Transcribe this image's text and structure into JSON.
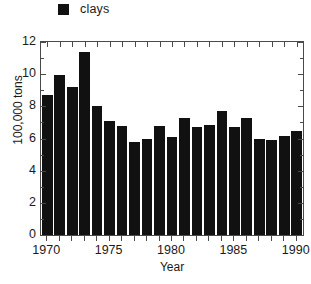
{
  "legend": {
    "entries": [
      {
        "label": "clays",
        "color": "#111111",
        "marker": "square"
      }
    ],
    "position": "top-left"
  },
  "axis_titles": {
    "x": "Year",
    "y": "100,000 tons"
  },
  "chart_data": {
    "type": "bar",
    "title": "",
    "subtitle": "",
    "xlabel": "Year",
    "ylabel": "100,000 tons",
    "xlim": [
      1969.5,
      1990.5
    ],
    "ylim": [
      0,
      12
    ],
    "grid": false,
    "legend_position": "top-left",
    "bar_color": "#111111",
    "categories": [
      "1970",
      "1971",
      "1972",
      "1973",
      "1974",
      "1975",
      "1976",
      "1977",
      "1978",
      "1979",
      "1980",
      "1981",
      "1982",
      "1983",
      "1984",
      "1985",
      "1986",
      "1987",
      "1988",
      "1989",
      "1990"
    ],
    "series": [
      {
        "name": "clays",
        "values": [
          8.7,
          9.95,
          9.2,
          11.4,
          8.05,
          7.1,
          6.8,
          5.8,
          6.0,
          6.8,
          6.1,
          7.3,
          6.7,
          6.85,
          7.7,
          6.7,
          7.25,
          5.95,
          5.9,
          6.15,
          6.45
        ]
      }
    ],
    "yticks": [
      0,
      2,
      4,
      6,
      8,
      10,
      12
    ],
    "ytick_labels": [
      "0",
      "2",
      "4",
      "6",
      "8",
      "10",
      "12"
    ],
    "xticks": [
      1970,
      1975,
      1980,
      1985,
      1990
    ],
    "xtick_labels": [
      "1970",
      "1975",
      "1980",
      "1985",
      "1990"
    ]
  },
  "caption": {
    "text": ""
  }
}
